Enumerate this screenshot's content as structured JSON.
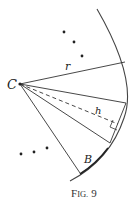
{
  "figure": {
    "caption_main": "F",
    "caption_small": "IG.",
    "caption_num": "9",
    "labels": {
      "center": "C",
      "radius": "r",
      "height": "h",
      "base": "B"
    },
    "colors": {
      "stroke": "#333333",
      "background": "#ffffff"
    }
  }
}
